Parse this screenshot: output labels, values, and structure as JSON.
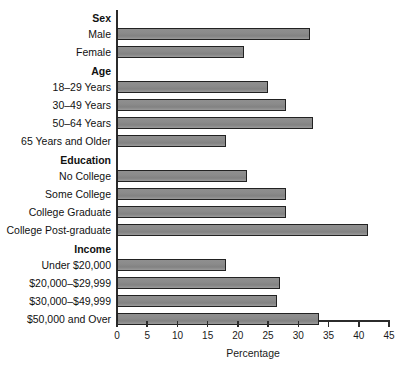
{
  "chart_data": {
    "type": "bar",
    "orientation": "horizontal",
    "title": "",
    "xlabel": "Percentage",
    "ylabel": "",
    "xlim": [
      0,
      45
    ],
    "xticks": [
      0,
      5,
      10,
      15,
      20,
      25,
      30,
      35,
      40,
      45
    ],
    "grid": false,
    "legend": null,
    "bar_color": "#8b8b8b",
    "bar_edge_color": "#222222",
    "groups": [
      {
        "name": "Sex",
        "categories": [
          "Male",
          "Female"
        ],
        "values": [
          32,
          21
        ]
      },
      {
        "name": "Age",
        "categories": [
          "18–29 Years",
          "30–49 Years",
          "50–64 Years",
          "65 Years and Older"
        ],
        "values": [
          25,
          28,
          32.5,
          18
        ]
      },
      {
        "name": "Education",
        "categories": [
          "No College",
          "Some College",
          "College Graduate",
          "College Post-graduate"
        ],
        "values": [
          21.5,
          28,
          28,
          41.5
        ]
      },
      {
        "name": "Income",
        "categories": [
          "Under $20,000",
          "$20,000–$29,999",
          "$30,000–$49,999",
          "$50,000 and Over"
        ],
        "values": [
          18,
          27,
          26.5,
          33.5
        ]
      }
    ]
  },
  "axis": {
    "tick_labels": [
      "0",
      "5",
      "10",
      "15",
      "20",
      "25",
      "30",
      "35",
      "40",
      "45"
    ],
    "x_title": "Percentage"
  },
  "rows": [
    {
      "label": "Sex",
      "type": "group",
      "value": null
    },
    {
      "label": "Male",
      "type": "bar",
      "value": 32
    },
    {
      "label": "Female",
      "type": "bar",
      "value": 21
    },
    {
      "label": "Age",
      "type": "group",
      "value": null
    },
    {
      "label": "18–29 Years",
      "type": "bar",
      "value": 25
    },
    {
      "label": "30–49 Years",
      "type": "bar",
      "value": 28
    },
    {
      "label": "50–64 Years",
      "type": "bar",
      "value": 32.5
    },
    {
      "label": "65 Years and Older",
      "type": "bar",
      "value": 18
    },
    {
      "label": "Education",
      "type": "group",
      "value": null
    },
    {
      "label": "No College",
      "type": "bar",
      "value": 21.5
    },
    {
      "label": "Some College",
      "type": "bar",
      "value": 28
    },
    {
      "label": "College Graduate",
      "type": "bar",
      "value": 28
    },
    {
      "label": "College Post-graduate",
      "type": "bar",
      "value": 41.5
    },
    {
      "label": "Income",
      "type": "group",
      "value": null
    },
    {
      "label": "Under $20,000",
      "type": "bar",
      "value": 18
    },
    {
      "label": "$20,000–$29,999",
      "type": "bar",
      "value": 27
    },
    {
      "label": "$30,000–$49,999",
      "type": "bar",
      "value": 26.5
    },
    {
      "label": "$50,000 and Over",
      "type": "bar",
      "value": 33.5
    }
  ]
}
